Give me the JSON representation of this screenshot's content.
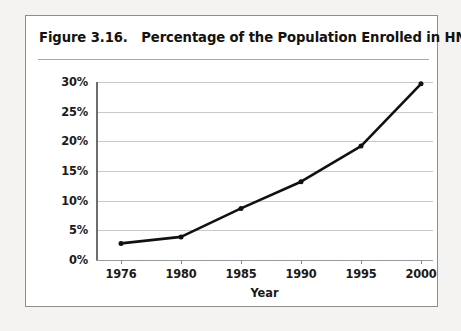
{
  "figure": {
    "title": "Figure 3.16.   Percentage of the Population Enrolled in HMOs",
    "border_color": "#8d8d8d",
    "background_color": "#ffffff"
  },
  "chart_data": {
    "type": "line",
    "title": "Figure 3.16.   Percentage of the Population Enrolled in HMOs",
    "xlabel": "Year",
    "ylabel": "",
    "categories": [
      "1976",
      "1980",
      "1985",
      "1990",
      "1995",
      "2000"
    ],
    "x": [
      1976,
      1980,
      1985,
      1990,
      1995,
      2000
    ],
    "values": [
      2.8,
      3.9,
      8.7,
      13.2,
      19.2,
      29.7
    ],
    "series": [
      {
        "name": "Percentage of the Population Enrolled in HMOs",
        "values": [
          2.8,
          3.9,
          8.7,
          13.2,
          19.2,
          29.7
        ]
      }
    ],
    "ylim": [
      0,
      30
    ],
    "yticks": [
      0,
      5,
      10,
      15,
      20,
      25,
      30
    ],
    "ytick_labels": [
      "0%",
      "5%",
      "10%",
      "15%",
      "20%",
      "25%",
      "30%"
    ],
    "xtick_labels": [
      "1976",
      "1980",
      "1985",
      "1990",
      "1995",
      "2000"
    ],
    "x_spacing": "ordinal",
    "grid": true,
    "grid_axis": "y",
    "grid_color": "#c9c9c9",
    "legend": false,
    "legend_position": "none",
    "line_color": "#111111",
    "line_width": 2.6,
    "marker": "circle",
    "marker_color": "#111111",
    "marker_size": 4
  },
  "axes": {
    "y_labels": [
      "30%",
      "25%",
      "20%",
      "15%",
      "10%",
      "5%",
      "0%"
    ],
    "x_labels": [
      "1976",
      "1980",
      "1985",
      "1990",
      "1995",
      "2000"
    ],
    "x_title": "Year"
  }
}
